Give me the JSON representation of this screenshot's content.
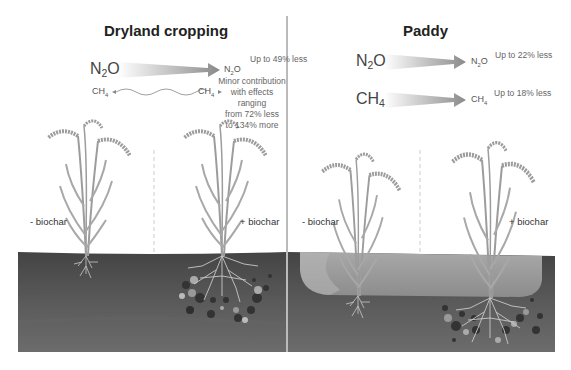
{
  "panels": {
    "dryland": {
      "title": "Dryland cropping",
      "n2o": {
        "from": "N",
        "sub": "2",
        "tail": "O",
        "to_main": "N",
        "to_sub": "2",
        "to_tail": "O",
        "note": "Up to 49% less"
      },
      "ch4": {
        "from": "CH",
        "sub": "4",
        "to_main": "CH",
        "to_sub": "4",
        "note_lines": [
          "Minor contribution",
          "with effects ranging",
          "from 72% less",
          "to 134% more"
        ]
      },
      "labels": {
        "minus": "- biochar",
        "plus": "+ biochar"
      }
    },
    "paddy": {
      "title": "Paddy",
      "n2o": {
        "from": "N",
        "sub": "2",
        "tail": "O",
        "to_main": "N",
        "to_sub": "2",
        "to_tail": "O",
        "note": "Up to 22% less"
      },
      "ch4": {
        "from": "CH",
        "sub": "4",
        "to_main": "CH",
        "to_sub": "4",
        "note": "Up to 18% less"
      },
      "labels": {
        "minus": "- biochar",
        "plus": "+ biochar"
      }
    }
  },
  "colors": {
    "soil_top": "#4a4a4a",
    "soil_mid": "#5c5c5c",
    "soil_bottom": "#6a6a6a",
    "water": "#9a9a9a",
    "plant": "#9c9c9c",
    "root": "#c8c8c8",
    "arrow": "#8a8a8a"
  }
}
